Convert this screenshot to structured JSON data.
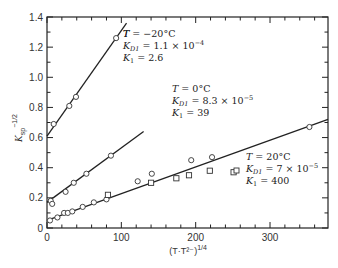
{
  "chart_data": {
    "type": "scatter",
    "title": "",
    "xlabel": "(T·T²⁻)^1/4",
    "ylabel": "K_sp^-1/2",
    "xlim": [
      0,
      378
    ],
    "ylim": [
      0,
      1.4
    ],
    "x_ticks": [
      0,
      100,
      200,
      300
    ],
    "y_ticks": [
      0,
      0.2,
      0.4,
      0.6,
      0.8,
      1.0,
      1.2,
      1.4
    ],
    "grid": false,
    "legend": "inline annotations",
    "series": [
      {
        "name": "T = -20°C",
        "marker": "circle",
        "points": [
          [
            9,
            0.69
          ],
          [
            30,
            0.81
          ],
          [
            39,
            0.87
          ],
          [
            93,
            1.26
          ]
        ],
        "fit_line": {
          "x0": 0,
          "y0": 0.61,
          "x1": 107,
          "y1": 1.36
        },
        "annotation": {
          "lines": [
            "T = −20°C",
            "K_D1 = 1.1 × 10⁻⁴",
            "K_1 = 2.6"
          ]
        }
      },
      {
        "name": "T = 0°C",
        "marker": "circle",
        "points": [
          [
            5,
            0.18
          ],
          [
            7,
            0.16
          ],
          [
            25,
            0.24
          ],
          [
            36,
            0.3
          ],
          [
            53,
            0.36
          ],
          [
            86,
            0.48
          ]
        ],
        "fit_line": {
          "x0": 0,
          "y0": 0.17,
          "x1": 130,
          "y1": 0.64
        },
        "annotation": {
          "lines": [
            "T = 0°C",
            "K_D1 = 8.3 × 10⁻⁵",
            "K_1 = 39"
          ]
        }
      },
      {
        "name": "T = 20°C",
        "marker": "circle",
        "points": [
          [
            4,
            0.05
          ],
          [
            14,
            0.07
          ],
          [
            23,
            0.1
          ],
          [
            28,
            0.1
          ],
          [
            34,
            0.11
          ],
          [
            48,
            0.14
          ],
          [
            63,
            0.17
          ],
          [
            80,
            0.19
          ],
          [
            122,
            0.31
          ],
          [
            141,
            0.36
          ],
          [
            194,
            0.45
          ],
          [
            222,
            0.47
          ],
          [
            353,
            0.67
          ]
        ],
        "fit_line": {
          "x0": 0,
          "y0": 0.05,
          "x1": 378,
          "y1": 0.72
        },
        "annotation": {
          "lines": [
            "T = 20°C",
            "K_D1 = 7 × 10⁻⁵",
            "K_1 = 400"
          ]
        }
      },
      {
        "name": "T = 20°C (squares)",
        "marker": "square",
        "points": [
          [
            82,
            0.22
          ],
          [
            140,
            0.3
          ],
          [
            174,
            0.33
          ],
          [
            191,
            0.35
          ],
          [
            219,
            0.38
          ],
          [
            251,
            0.37
          ]
        ]
      }
    ]
  },
  "labels": {
    "ylabel_main": "K",
    "ylabel_sub": "sp",
    "ylabel_sup": "−1/2",
    "xlabel_main": "(T·T²⁻)",
    "xlabel_sup": "1/4",
    "ann1": {
      "l1": "T = −20°C",
      "l2a": "K",
      "l2b": "D1",
      "l2c": " = 1.1 × 10",
      "l2d": "−4",
      "l3a": "K",
      "l3b": "1",
      "l3c": " = 2.6"
    },
    "ann2": {
      "l1": "T = 0°C",
      "l2a": "K",
      "l2b": "D1",
      "l2c": " = 8.3 × 10",
      "l2d": "−5",
      "l3a": "K",
      "l3b": "1",
      "l3c": " = 39"
    },
    "ann3": {
      "l1": "T = 20°C",
      "l2a": "K",
      "l2b": "D1",
      "l2c": " = 7 × 10",
      "l2d": "−5",
      "l3a": "K",
      "l3b": "1",
      "l3c": " = 400"
    }
  }
}
